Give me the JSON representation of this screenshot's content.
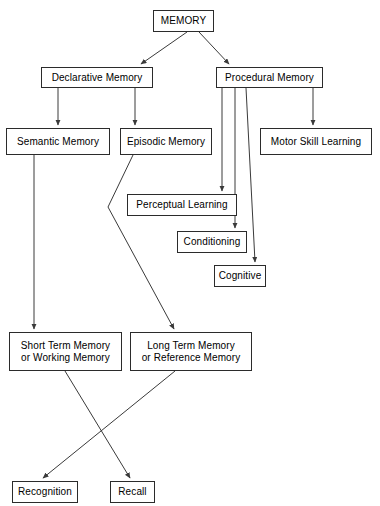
{
  "diagram": {
    "type": "flowchart",
    "background_color": "#ffffff",
    "line_color": "#3a3a3a",
    "box_border_color": "#2b2b2b",
    "text_color": "#000000",
    "nodes": [
      {
        "id": "memory",
        "label": "MEMORY",
        "x": 153,
        "y": 10,
        "w": 61,
        "h": 22
      },
      {
        "id": "declarative",
        "label": "Declarative Memory",
        "x": 41,
        "y": 67,
        "w": 112,
        "h": 21
      },
      {
        "id": "procedural",
        "label": "Procedural Memory",
        "x": 216,
        "y": 67,
        "w": 107,
        "h": 21
      },
      {
        "id": "semantic",
        "label": "Semantic Memory",
        "x": 6,
        "y": 128,
        "w": 104,
        "h": 27
      },
      {
        "id": "episodic",
        "label": "Episodic Memory",
        "x": 120,
        "y": 128,
        "w": 92,
        "h": 27
      },
      {
        "id": "motor",
        "label": "Motor Skill Learning",
        "x": 260,
        "y": 128,
        "w": 112,
        "h": 27
      },
      {
        "id": "perceptual",
        "label": "Perceptual Learning",
        "x": 127,
        "y": 194,
        "w": 110,
        "h": 22
      },
      {
        "id": "conditioning",
        "label": "Conditioning",
        "x": 177,
        "y": 231,
        "w": 70,
        "h": 22
      },
      {
        "id": "cognitive",
        "label": "Cognitive",
        "x": 214,
        "y": 265,
        "w": 52,
        "h": 22
      },
      {
        "id": "short_term",
        "label": "Short Term Memory\nor Working Memory",
        "x": 9,
        "y": 332,
        "w": 113,
        "h": 39
      },
      {
        "id": "long_term",
        "label": "Long Term Memory\nor Reference Memory",
        "x": 130,
        "y": 332,
        "w": 122,
        "h": 39
      },
      {
        "id": "recognition",
        "label": "Recognition",
        "x": 12,
        "y": 481,
        "w": 66,
        "h": 22
      },
      {
        "id": "recall",
        "label": "Recall",
        "x": 110,
        "y": 481,
        "w": 45,
        "h": 22
      }
    ],
    "edges": [
      {
        "id": "memory-declarative",
        "from": "memory",
        "to": "declarative",
        "points": "187,32 141,64"
      },
      {
        "id": "memory-procedural",
        "from": "memory",
        "to": "procedural",
        "points": "199,32 229,64"
      },
      {
        "id": "declarative-semantic",
        "from": "declarative",
        "to": "semantic",
        "points": "58,88 58,125"
      },
      {
        "id": "declarative-episodic",
        "from": "declarative",
        "to": "episodic",
        "points": "135,88 135,125"
      },
      {
        "id": "procedural-perceptual",
        "from": "procedural",
        "to": "perceptual",
        "points": "222,88 222,191"
      },
      {
        "id": "procedural-conditioning",
        "from": "procedural",
        "to": "conditioning",
        "points": "235,88 235,228"
      },
      {
        "id": "procedural-cognitive",
        "from": "procedural",
        "to": "cognitive",
        "points": "246,88 255,262"
      },
      {
        "id": "procedural-motor",
        "from": "procedural",
        "to": "motor",
        "points": "313,88 313,125"
      },
      {
        "id": "semantic-short-term",
        "from": "semantic",
        "to": "short_term",
        "points": "34,155 34,329"
      },
      {
        "id": "episodic-long-term",
        "from": "episodic",
        "to": "long_term",
        "points": "133,155 108,207 174,329"
      },
      {
        "id": "short-term-recall",
        "from": "short_term",
        "to": "recall",
        "points": "65,371 130,478"
      },
      {
        "id": "long-term-recognition",
        "from": "long_term",
        "to": "recognition",
        "points": "175,371 43,478"
      }
    ]
  }
}
